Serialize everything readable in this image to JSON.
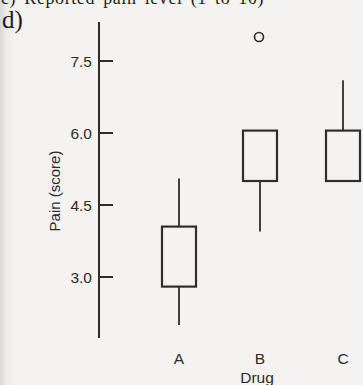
{
  "page": {
    "top_caption_clipped": "c) Reported pain level (1 to 10)",
    "panel_label": "d)"
  },
  "chart_data": {
    "type": "boxplot",
    "title": "",
    "xlabel": "Drug",
    "ylabel": "Pain (score)",
    "categories": [
      "A",
      "B",
      "C"
    ],
    "y_ticks": [
      3.0,
      4.5,
      6.0,
      7.5
    ],
    "y_tick_labels": [
      "3.0",
      "4.5",
      "6.0",
      "7.5"
    ],
    "ylim": [
      1.7,
      8.3
    ],
    "grid": false,
    "median_line_shown": false,
    "whisker_caps_shown": false,
    "series": [
      {
        "category": "A",
        "whisker_low": 2.0,
        "q1": 2.8,
        "q3": 4.05,
        "whisker_high": 5.05,
        "outliers": []
      },
      {
        "category": "B",
        "whisker_low": 3.95,
        "q1": 5.0,
        "q3": 6.05,
        "whisker_high": null,
        "outliers": [
          8.0
        ]
      },
      {
        "category": "C",
        "whisker_low": null,
        "q1": 5.0,
        "q3": 6.05,
        "whisker_high": 7.1,
        "outliers": []
      }
    ],
    "ink_color": "#2e2e2e",
    "background_color": "#f4f3f1"
  }
}
